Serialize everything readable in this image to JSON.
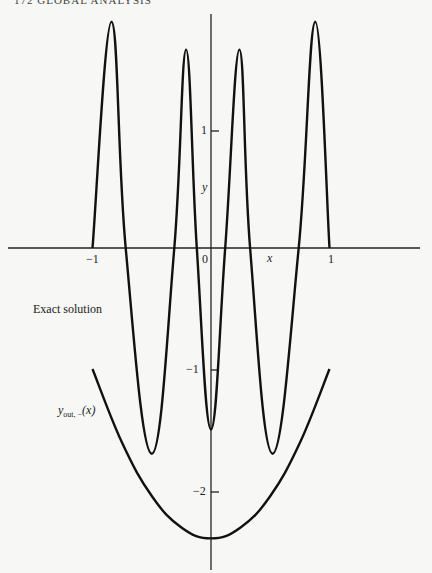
{
  "header": {
    "text": "172  GLOBAL ANALYSIS"
  },
  "chart_data": {
    "type": "line",
    "title": "",
    "xlabel": "x",
    "ylabel": "y",
    "xlim": [
      -1.75,
      1.8
    ],
    "ylim": [
      -2.65,
      1.93
    ],
    "x_ticks": [
      -1,
      0,
      1
    ],
    "x_tick_labels": [
      "−1",
      "0",
      "1"
    ],
    "y_ticks": [
      1,
      -1,
      -2
    ],
    "y_tick_labels": [
      "1",
      "−1",
      "−2"
    ],
    "grid": false,
    "annotations": [
      {
        "text": "Exact solution",
        "x": -1.6,
        "y": -0.55
      },
      {
        "text": "y_out,−(x)",
        "x": -1.28,
        "y": -1.36
      }
    ],
    "series": [
      {
        "name": "Exact solution",
        "x": [
          -1,
          -0.84,
          -0.72,
          -0.5,
          -0.31,
          -0.21,
          -0.12,
          0,
          0.12,
          0.24,
          0.33,
          0.52,
          0.74,
          0.88,
          1
        ],
        "y": [
          0,
          1.87,
          0,
          -1.7,
          0,
          1.64,
          0,
          -1.5,
          0,
          1.64,
          0,
          -1.7,
          0,
          1.87,
          0
        ]
      },
      {
        "name": "y_out,−(x)",
        "x": [
          -1,
          -0.75,
          -0.5,
          -0.25,
          0,
          0.25,
          0.5,
          0.75,
          1
        ],
        "y": [
          -1.0,
          -1.61,
          -2.05,
          -2.31,
          -2.4,
          -2.31,
          -2.05,
          -1.61,
          -1.0
        ]
      }
    ]
  },
  "labels": {
    "x_axis": "x",
    "y_axis": "y",
    "tick_x_neg1": "−1",
    "tick_x_0": "0",
    "tick_x_1": "1",
    "tick_y_1": "1",
    "tick_y_neg1": "−1",
    "tick_y_neg2": "−2",
    "exact_solution": "Exact solution",
    "yout_main": "y",
    "yout_sub": "out, −",
    "yout_arg": "(x)"
  }
}
